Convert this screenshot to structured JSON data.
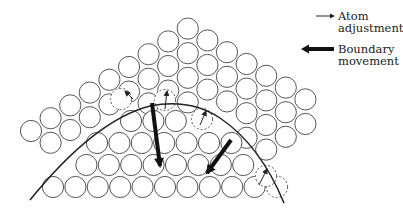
{
  "figure": {
    "stroke_color": "#555555",
    "atom_radius": 10.6
  },
  "legend": {
    "items": [
      {
        "label_line1": "Atom",
        "label_line2": "adjustment",
        "icon": "thin-arrow-icon"
      },
      {
        "label_line1": "Boundary",
        "label_line2": "movement",
        "icon": "thick-arrow-icon"
      }
    ]
  },
  "upper_grain": {
    "origin": [
      31,
      131
    ],
    "vec_a": [
      19.6,
      -12.8
    ],
    "vec_b": [
      0,
      24.6
    ],
    "columns": [
      {
        "i": 0,
        "j": [
          0,
          0
        ]
      },
      {
        "i": 1,
        "j": [
          0,
          1
        ]
      },
      {
        "i": 2,
        "j": [
          0,
          2
        ]
      },
      {
        "i": 3,
        "j": [
          0,
          2
        ]
      },
      {
        "i": 4,
        "j": [
          0,
          3
        ]
      },
      {
        "i": 5,
        "j": [
          0,
          3
        ]
      },
      {
        "i": 6,
        "j": [
          0,
          4
        ]
      },
      {
        "i": 7,
        "j": [
          0,
          4
        ]
      },
      {
        "i": 8,
        "j": [
          0,
          5
        ]
      },
      {
        "i": 9,
        "j": [
          1,
          5
        ]
      },
      {
        "i": 10,
        "j": [
          2,
          6
        ]
      },
      {
        "i": 11,
        "j": [
          3,
          6
        ]
      },
      {
        "i": 12,
        "j": [
          4,
          7
        ]
      },
      {
        "i": 13,
        "j": [
          5,
          7
        ]
      },
      {
        "i": 14,
        "j": [
          6,
          7
        ]
      }
    ]
  },
  "lower_grain": {
    "rows": [
      {
        "y": 187,
        "x_start": 53,
        "count": 10
      },
      {
        "y": 165,
        "x_start": 64,
        "count": 10
      },
      {
        "y": 143,
        "x_start": 97,
        "count": 7
      },
      {
        "y": 121,
        "x_start": 131,
        "count": 3
      }
    ],
    "spacing": 22.4
  },
  "dashed_atoms": [
    [
      121,
      99
    ],
    [
      165,
      100
    ],
    [
      202,
      119
    ],
    [
      277,
      187
    ],
    [
      266,
      176
    ]
  ],
  "boundary_curve": {
    "path": "M30 200 Q 95 120 150 106 Q 190 98 220 118 Q 260 145 284 203"
  },
  "boundary_arrows": [
    {
      "from": [
        152,
        103
      ],
      "to": [
        160,
        166
      ]
    },
    {
      "from": [
        231,
        140
      ],
      "to": [
        207,
        173
      ]
    }
  ],
  "atom_arrows": [
    {
      "from": [
        133,
        99
      ],
      "to": [
        125,
        91
      ]
    },
    {
      "from": [
        165,
        109
      ],
      "to": [
        167,
        91
      ]
    },
    {
      "from": [
        200,
        125
      ],
      "to": [
        206,
        111
      ]
    },
    {
      "from": [
        259,
        185
      ],
      "to": [
        267,
        169
      ]
    }
  ]
}
